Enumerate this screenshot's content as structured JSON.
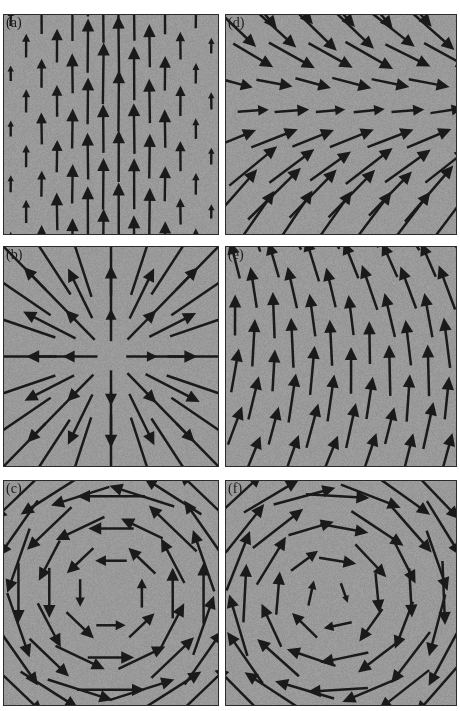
{
  "figure": {
    "kind": "vector-field-panel-grid",
    "background_color": "#ffffff",
    "panel_background_color": "#9a9a9a",
    "arrow_color": "#1a1a1a",
    "frame_color": "#2b2b2b",
    "rows": 3,
    "columns": 2,
    "panel_count": 6
  },
  "panels": [
    {
      "id": "a",
      "label": "(a)",
      "position": {
        "row": 1,
        "column": 1
      },
      "field_type": "uniform-upward",
      "description": "Uniform upward arrows on a staggered grid; arrow length increases toward the central columns.",
      "chart_data": {
        "type": "quiver",
        "grid": "staggered",
        "direction_deg": 90,
        "length_profile": "peaked-at-center-column"
      }
    },
    {
      "id": "b",
      "label": "(b)",
      "position": {
        "row": 2,
        "column": 1
      },
      "field_type": "radial-source",
      "description": "Radial outward (source) field; arrows point away from the centre, growing with radius.",
      "chart_data": {
        "type": "quiver",
        "grid": "regular",
        "center": [
          0.5,
          0.5
        ],
        "radial_component": 1,
        "tangential_component": 0
      }
    },
    {
      "id": "c",
      "label": "(c)",
      "position": {
        "row": 3,
        "column": 1
      },
      "field_type": "vortex-counterclockwise",
      "description": "Counter-clockwise vortex; arrows circulate about a central core.",
      "chart_data": {
        "type": "quiver",
        "grid": "regular",
        "center": [
          0.5,
          0.5
        ],
        "radial_component": 0,
        "tangential_component": 1,
        "sense": "counterclockwise"
      }
    },
    {
      "id": "d",
      "label": "(d)",
      "position": {
        "row": 1,
        "column": 2
      },
      "field_type": "shear-convergent",
      "description": "Predominantly rightward flow that converges onto a horizontal axis; arrows tilt down above and up below.",
      "chart_data": {
        "type": "quiver",
        "grid": "regular",
        "center": [
          0.5,
          0.5
        ],
        "u_component": 1,
        "v_component": "-k*(y-yc)"
      }
    },
    {
      "id": "e",
      "label": "(e)",
      "position": {
        "row": 2,
        "column": 2
      },
      "field_type": "tilted-upward",
      "description": "Mostly upward arrows with a gentle tilt that rotates across the field.",
      "chart_data": {
        "type": "quiver",
        "grid": "regular",
        "direction_deg": 90,
        "tilt_range_deg": [
          -25,
          35
        ]
      }
    },
    {
      "id": "f",
      "label": "(f)",
      "position": {
        "row": 3,
        "column": 2
      },
      "field_type": "vortex-clockwise",
      "description": "Clockwise vortex; arrows circulate about a central core in the opposite sense to panel (c).",
      "chart_data": {
        "type": "quiver",
        "grid": "regular",
        "center": [
          0.5,
          0.5
        ],
        "radial_component": 0,
        "tangential_component": -1,
        "sense": "clockwise"
      }
    }
  ]
}
